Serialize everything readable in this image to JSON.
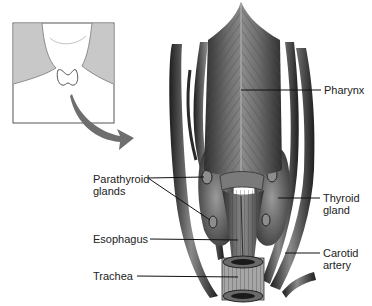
{
  "inset": {
    "description": "Neck silhouette showing thyroid location",
    "arrow_color": "#6e6e6e",
    "shade_color": "#c8c8c8"
  },
  "labels": {
    "pharynx": "Pharynx",
    "parathyroid": "Parathyroid\nglands",
    "thyroid": "Thyroid\ngland",
    "esophagus": "Esophagus",
    "carotid": "Carotid\nartery",
    "trachea": "Trachea"
  },
  "colors": {
    "muscle_dark": "#3a3a3a",
    "muscle_mid": "#6a6a6a",
    "muscle_light": "#9a9a9a",
    "leader_line": "#111111",
    "text": "#222222"
  }
}
